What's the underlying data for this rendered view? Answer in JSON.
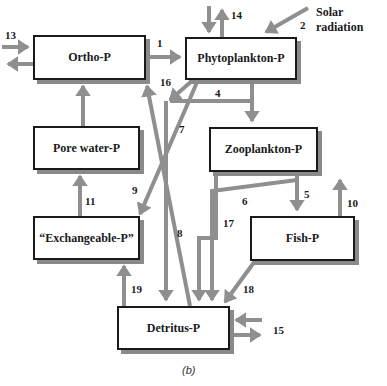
{
  "diagram": {
    "caption": "(b)",
    "colors": {
      "arrow": "#8f8f8f",
      "box_border": "#1a1a1a",
      "shadow": "#8a8a8a"
    },
    "boxes": {
      "ortho": "Ortho-P",
      "phyto": "Phytoplankton-P",
      "pore": "Pore water-P",
      "zoo": "Zooplankton-P",
      "exch": "“Exchangeable-P”",
      "fish": "Fish-P",
      "detritus": "Detritus-P"
    },
    "external": {
      "solar": "Solar radiation"
    },
    "flow_labels": {
      "f1": "1",
      "f2": "2",
      "f4": "4",
      "f5": "5",
      "f6": "6",
      "f7": "7",
      "f8": "8",
      "f9": "9",
      "f10": "10",
      "f11": "11",
      "f13": "13",
      "f14": "14",
      "f15": "15",
      "f16": "16",
      "f17": "17",
      "f18": "18",
      "f19": "19"
    }
  }
}
